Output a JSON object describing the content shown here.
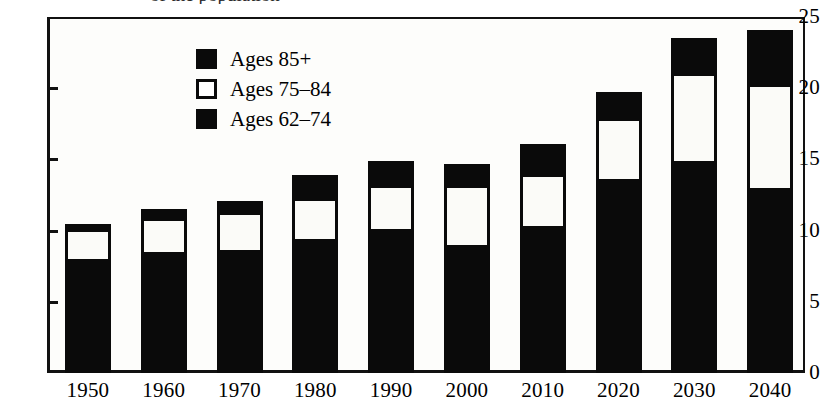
{
  "chart_data": {
    "type": "bar",
    "stacked": true,
    "title": "",
    "xlabel": "",
    "ylabel": "",
    "ylim": [
      0,
      25
    ],
    "yticks": [
      0,
      5,
      10,
      15,
      20,
      25
    ],
    "grid": false,
    "legend_position": "inside-upper-left",
    "categories": [
      "1950",
      "1960",
      "1970",
      "1980",
      "1990",
      "2000",
      "2010",
      "2020",
      "2030",
      "2040"
    ],
    "series": [
      {
        "name": "Ages 62–74",
        "color": "#0a0a0a",
        "values": [
          7.8,
          8.3,
          8.4,
          9.2,
          9.9,
          8.8,
          10.1,
          13.4,
          14.7,
          12.8
        ]
      },
      {
        "name": "Ages 75–84",
        "color": "#ffffff",
        "values": [
          2.3,
          2.6,
          2.9,
          3.1,
          3.3,
          4.4,
          3.9,
          4.5,
          6.4,
          7.5
        ]
      },
      {
        "name": "Ages 85+",
        "color": "#0a0a0a",
        "values": [
          0.4,
          0.6,
          0.8,
          1.6,
          1.7,
          1.5,
          2.1,
          1.8,
          2.4,
          3.8
        ]
      }
    ],
    "totals": [
      10.5,
      11.5,
      12.1,
      13.9,
      14.9,
      14.7,
      16.1,
      19.7,
      23.5,
      24.1
    ]
  },
  "axes": {
    "y_tick_labels": [
      "25",
      "20",
      "15",
      "10",
      "5",
      "0"
    ],
    "x_tick_labels": [
      "1950",
      "1960",
      "1970",
      "1980",
      "1990",
      "2000",
      "2010",
      "2020",
      "2030",
      "2040"
    ]
  },
  "legend": {
    "items": [
      {
        "label": "Ages 85+",
        "swatch": "black"
      },
      {
        "label": "Ages 75–84",
        "swatch": "white"
      },
      {
        "label": "Ages 62–74",
        "swatch": "black"
      }
    ]
  },
  "top_sliver": {
    "text": "of the population"
  }
}
